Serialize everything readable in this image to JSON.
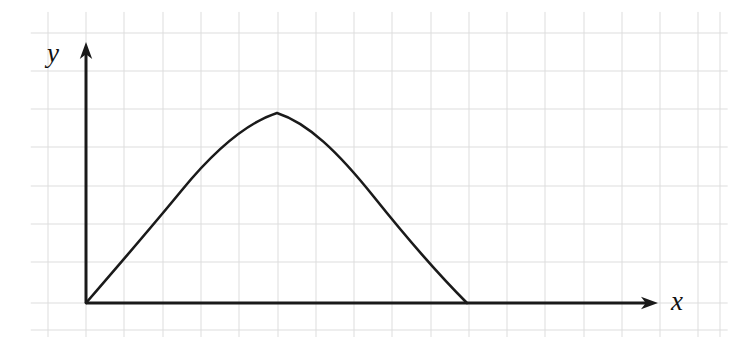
{
  "figure": {
    "background_color": "#ffffff",
    "width": 735,
    "height": 337
  },
  "axes": {
    "color": "#1a1a1a",
    "line_width": 3,
    "origin": {
      "x": 86,
      "y": 303
    },
    "x_axis": {
      "label": "x",
      "label_x": 677,
      "label_y": 310,
      "label_font_size": 27,
      "start_x": 86,
      "end_x": 658,
      "y": 303,
      "arrowhead": "right-arrow"
    },
    "y_axis": {
      "label": "y",
      "label_x": 53,
      "label_y": 62,
      "label_font_size": 27,
      "x": 86,
      "start_y": 303,
      "end_y": 42,
      "arrowhead": "up-arrow"
    }
  },
  "grid": {
    "color": "#dddddd",
    "line_width": 1,
    "spacing": 38.3,
    "x_start": 48,
    "y_start": 33,
    "x_lines": [
      48,
      86,
      124,
      163,
      201,
      239,
      278,
      316,
      354,
      392,
      431,
      469,
      507,
      545,
      584,
      622,
      660,
      698,
      720
    ],
    "y_lines": [
      33,
      71,
      109,
      147,
      186,
      224,
      262,
      303,
      330
    ]
  },
  "curve": {
    "color": "#1a1a1a",
    "line_width": 2.6,
    "fill": "none",
    "shape": "asymmetric-arch",
    "launch_point": {
      "x": 86,
      "y": 303
    },
    "apex_point": {
      "x": 277,
      "y": 113
    },
    "landing_point": {
      "x": 467,
      "y": 303
    },
    "path": "M 86 303 C 118 266, 150 229, 182 190 C 214 151, 246 123, 277 113 C 308 123, 338 152, 374 197 C 410 242, 442 278, 467 303"
  },
  "chart_data": {
    "type": "line",
    "title": "",
    "xlabel": "x",
    "ylabel": "y",
    "grid": true,
    "legend": null,
    "xlim": [
      0,
      15
    ],
    "ylim": [
      0,
      7
    ],
    "x": [
      0.0,
      0.5,
      1.0,
      1.5,
      2.0,
      2.5,
      3.0,
      3.5,
      4.0,
      4.5,
      5.0,
      5.5,
      6.0,
      6.5,
      7.0,
      7.5,
      8.0,
      8.5,
      9.0,
      9.5,
      10.0
    ],
    "y": [
      0.0,
      0.62,
      1.21,
      1.78,
      2.31,
      2.81,
      3.27,
      3.7,
      4.08,
      4.42,
      4.7,
      4.92,
      5.0,
      4.92,
      4.7,
      4.35,
      3.85,
      3.2,
      2.4,
      1.35,
      0.0
    ],
    "series": [
      {
        "name": "trajectory",
        "values": [
          0.0,
          0.62,
          1.21,
          1.78,
          2.31,
          2.81,
          3.27,
          3.7,
          4.08,
          4.42,
          4.7,
          4.92,
          5.0,
          4.92,
          4.7,
          4.35,
          3.85,
          3.2,
          2.4,
          1.35,
          0.0
        ]
      }
    ],
    "annotations": [
      {
        "label": "origin",
        "x": 0.0,
        "y": 0.0
      },
      {
        "label": "apex",
        "x": 5.0,
        "y": 5.0
      },
      {
        "label": "landing",
        "x": 10.0,
        "y": 0.0
      }
    ]
  }
}
